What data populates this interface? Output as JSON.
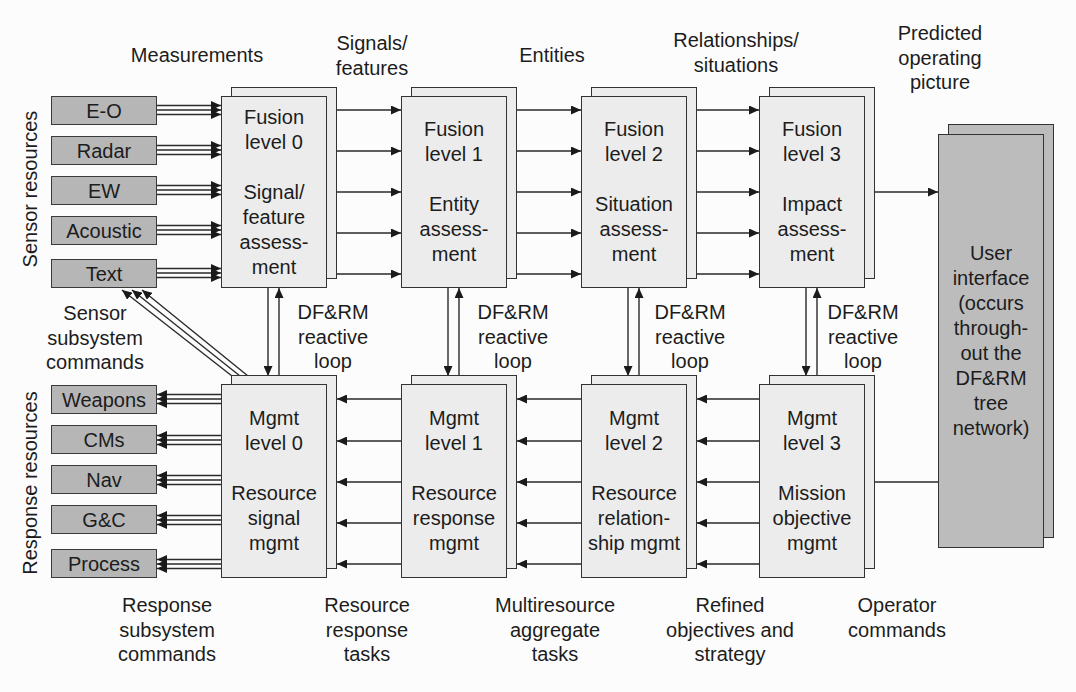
{
  "column_headers": {
    "measurements": "Measurements",
    "signals_features": "Signals/\nfeatures",
    "entities": "Entities",
    "relationships_situations": "Relationships/\nsituations",
    "predicted_operating_picture": "Predicted\noperating\npicture"
  },
  "side_labels": {
    "sensor_resources": "Sensor resources",
    "response_resources": "Response resources"
  },
  "sensor_resources": [
    {
      "label": "E-O"
    },
    {
      "label": "Radar"
    },
    {
      "label": "EW"
    },
    {
      "label": "Acoustic"
    },
    {
      "label": "Text"
    }
  ],
  "response_resources": [
    {
      "label": "Weapons"
    },
    {
      "label": "CMs"
    },
    {
      "label": "Nav"
    },
    {
      "label": "G&C"
    },
    {
      "label": "Process"
    }
  ],
  "fusion_levels": [
    {
      "title": "Fusion\nlevel 0",
      "function": "Signal/\nfeature\nassess-\nment"
    },
    {
      "title": "Fusion\nlevel 1",
      "function": "Entity\nassess-\nment"
    },
    {
      "title": "Fusion\nlevel 2",
      "function": "Situation\nassess-\nment"
    },
    {
      "title": "Fusion\nlevel 3",
      "function": "Impact\nassess-\nment"
    }
  ],
  "management_levels": [
    {
      "title": "Mgmt\nlevel 0",
      "function": "Resource\nsignal\nmgmt"
    },
    {
      "title": "Mgmt\nlevel 1",
      "function": "Resource\nresponse\nmgmt"
    },
    {
      "title": "Mgmt\nlevel 2",
      "function": "Resource\nrelation-\nship mgmt"
    },
    {
      "title": "Mgmt\nlevel 3",
      "function": "Mission\nobjective\nmgmt"
    }
  ],
  "reactive_loops": [
    {
      "label": "DF&RM\nreactive\nloop"
    },
    {
      "label": "DF&RM\nreactive\nloop"
    },
    {
      "label": "DF&RM\nreactive\nloop"
    },
    {
      "label": "DF&RM\nreactive\nloop"
    }
  ],
  "user_interface": {
    "label": "User\ninterface\n(occurs\nthrough-\nout the\nDF&RM\ntree\nnetwork)"
  },
  "sensor_subsystem_commands": "Sensor\nsubsystem\ncommands",
  "bottom_labels": [
    {
      "label": "Response\nsubsystem\ncommands"
    },
    {
      "label": "Resource\nresponse\ntasks"
    },
    {
      "label": "Multiresource\naggregate\ntasks"
    },
    {
      "label": "Refined\nobjectives and\nstrategy"
    },
    {
      "label": "Operator\ncommands"
    }
  ],
  "colors": {
    "background": "#fcfcfc",
    "level_box_fill": "#ececec",
    "resource_box_fill": "#b6b6b6",
    "user_interface_fill": "#bcbcbc",
    "stroke": "#333333",
    "text": "#1c1c1c"
  }
}
